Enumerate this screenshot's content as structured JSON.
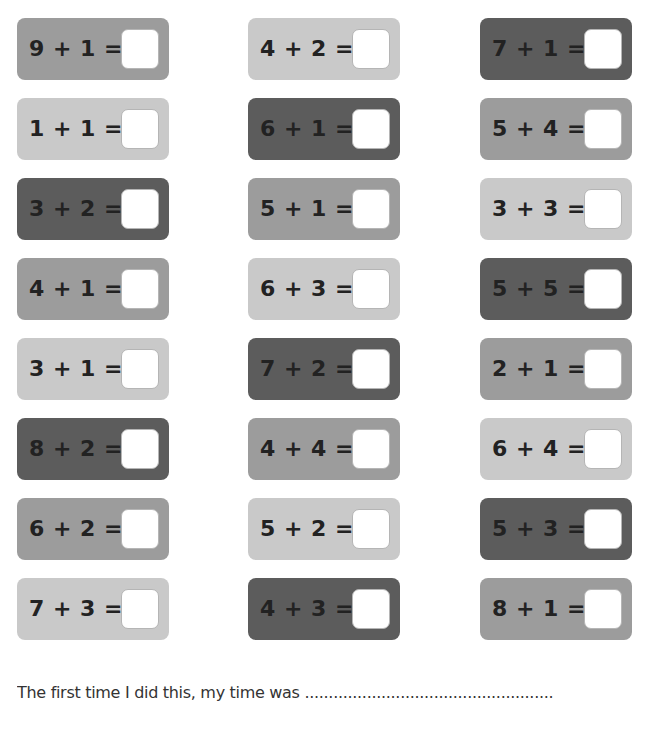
{
  "worksheet": {
    "columns": [
      {
        "x": 17,
        "cards": [
          {
            "equation": "9 + 1 =",
            "shade": "medium"
          },
          {
            "equation": "1 + 1 =",
            "shade": "light"
          },
          {
            "equation": "3 + 2 =",
            "shade": "dark"
          },
          {
            "equation": "4 + 1 =",
            "shade": "medium"
          },
          {
            "equation": "3 + 1 =",
            "shade": "light"
          },
          {
            "equation": "8 + 2 =",
            "shade": "dark"
          },
          {
            "equation": "6 + 2 =",
            "shade": "medium"
          },
          {
            "equation": "7 + 3 =",
            "shade": "light"
          }
        ]
      },
      {
        "x": 248,
        "cards": [
          {
            "equation": "4 + 2 =",
            "shade": "light"
          },
          {
            "equation": "6 + 1 =",
            "shade": "dark"
          },
          {
            "equation": "5 + 1 =",
            "shade": "medium"
          },
          {
            "equation": "6 + 3 =",
            "shade": "light"
          },
          {
            "equation": "7 + 2 =",
            "shade": "dark"
          },
          {
            "equation": "4 + 4 =",
            "shade": "medium"
          },
          {
            "equation": "5 + 2 =",
            "shade": "light"
          },
          {
            "equation": "4 + 3 =",
            "shade": "dark"
          }
        ]
      },
      {
        "x": 480,
        "cards": [
          {
            "equation": "7 + 1 =",
            "shade": "dark"
          },
          {
            "equation": "5 + 4 =",
            "shade": "medium"
          },
          {
            "equation": "3 + 3 =",
            "shade": "light"
          },
          {
            "equation": "5 + 5 =",
            "shade": "dark"
          },
          {
            "equation": "2 + 1 =",
            "shade": "medium"
          },
          {
            "equation": "6 + 4 =",
            "shade": "light"
          },
          {
            "equation": "5 + 3 =",
            "shade": "dark"
          },
          {
            "equation": "8 + 1 =",
            "shade": "medium"
          }
        ]
      }
    ],
    "row_tops": [
      18,
      98,
      178,
      258,
      338,
      418,
      498,
      578
    ],
    "colors": {
      "light": "#c9c9c9",
      "medium": "#9c9c9c",
      "dark": "#5c5c5c",
      "answer_box": "#ffffff",
      "text": "#222222"
    }
  },
  "footer": {
    "text": "The first time I did this, my time was ...................................................."
  }
}
